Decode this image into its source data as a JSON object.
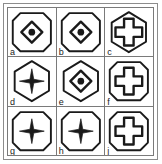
{
  "figure": {
    "rows": 3,
    "columns": 3,
    "stroke_color": "#1a1a1a",
    "grid_line_color": "#7a7a7a",
    "frame_color": "#8c8c8c",
    "background_color": "#ffffff",
    "cells": [
      {
        "label": "a",
        "outer_shape": "rounded-octagon",
        "inner_shape": "diamond-outline",
        "inner_detail": "filled-dot",
        "row": 1,
        "column": 1
      },
      {
        "label": "b",
        "outer_shape": "rounded-octagon",
        "inner_shape": "diamond-outline",
        "inner_detail": "filled-dot",
        "row": 1,
        "column": 2
      },
      {
        "label": "c",
        "outer_shape": "hexagon",
        "inner_shape": "cross-outline",
        "inner_detail": "none",
        "row": 1,
        "column": 3
      },
      {
        "label": "d",
        "outer_shape": "hexagon",
        "inner_shape": "four-point-star",
        "inner_detail": "none",
        "row": 2,
        "column": 1
      },
      {
        "label": "e",
        "outer_shape": "hexagon",
        "inner_shape": "diamond-outline",
        "inner_detail": "filled-dot",
        "row": 2,
        "column": 2
      },
      {
        "label": "f",
        "outer_shape": "rounded-octagon",
        "inner_shape": "cross-outline",
        "inner_detail": "none",
        "row": 2,
        "column": 3
      },
      {
        "label": "g",
        "outer_shape": "rounded-octagon",
        "inner_shape": "four-point-star",
        "inner_detail": "none",
        "row": 3,
        "column": 1
      },
      {
        "label": "h",
        "outer_shape": "rounded-octagon",
        "inner_shape": "four-point-star",
        "inner_detail": "none",
        "row": 3,
        "column": 2
      },
      {
        "label": "j",
        "outer_shape": "rounded-octagon",
        "inner_shape": "cross-outline",
        "inner_detail": "none",
        "row": 3,
        "column": 3
      }
    ]
  }
}
